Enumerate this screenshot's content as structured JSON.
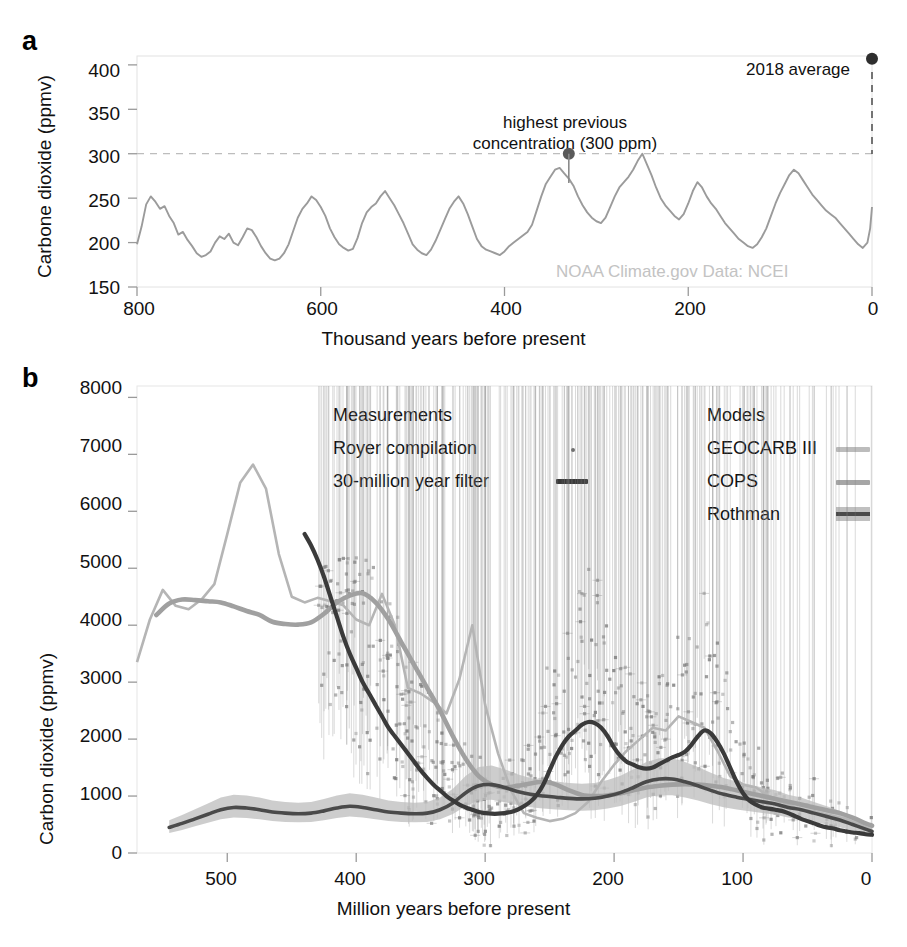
{
  "figure": {
    "panel_a_label": "a",
    "panel_b_label": "b"
  },
  "panel_a": {
    "ylabel": "Carbone dioxide (ppmv)",
    "xlabel": "Thousand years before present",
    "yticks": [
      "400",
      "350",
      "300",
      "250",
      "200",
      "150"
    ],
    "xticks": [
      "800",
      "600",
      "400",
      "200",
      "0"
    ],
    "annotation_2018": "2018 average",
    "annotation_highest_line1": "highest previous",
    "annotation_highest_line2": "concentration (300 ppm)",
    "credit": "NOAA Climate.gov  Data: NCEI",
    "curve_color": "#9b9b9b",
    "marker_color": "#3d3d3d"
  },
  "panel_b": {
    "ylabel": "Carbon dioxide (ppmv)",
    "xlabel": "Million years before present",
    "yticks": [
      "8000",
      "7000",
      "6000",
      "5000",
      "4000",
      "3000",
      "2000",
      "1000",
      "0"
    ],
    "xticks": [
      "500",
      "400",
      "300",
      "200",
      "100",
      "0"
    ],
    "legend": {
      "measurements_title": "Measurements",
      "royer_label": "Royer compilation",
      "filter_label": "30-million year filter",
      "models_title": "Models",
      "geocarb_label": "GEOCARB III",
      "cops_label": "COPS",
      "rothman_label": "Rothman"
    },
    "colors": {
      "geocarb": "#b5b5b5",
      "cops": "#a0a0a0",
      "rothman_line": "#4a4a4a",
      "rothman_band": "#b9b9b9",
      "filter_line": "#3a3a3a",
      "royer_points": "#7d7d7d"
    }
  },
  "chart_data": [
    {
      "type": "line",
      "panel": "a",
      "title": "",
      "xlabel": "Thousand years before present",
      "ylabel": "Carbone dioxide (ppmv)",
      "xlim": [
        800,
        0
      ],
      "ylim": [
        150,
        410
      ],
      "xticks": [
        800,
        600,
        400,
        200,
        0
      ],
      "yticks": [
        400,
        350,
        300,
        250,
        200,
        150
      ],
      "grid": false,
      "reference_line": {
        "y": 300,
        "style": "dashed",
        "label": "highest previous concentration (300 ppm)"
      },
      "annotations": [
        {
          "text": "2018 average",
          "x": 0,
          "y": 407
        },
        {
          "text": "highest previous concentration (300 ppm)",
          "x": 330,
          "y": 300
        }
      ],
      "markers": [
        {
          "name": "2018-average",
          "x": 0,
          "y": 407
        },
        {
          "name": "highest-previous",
          "x": 330,
          "y": 300
        }
      ],
      "series": [
        {
          "name": "Ice core CO2",
          "x": [
            800,
            795,
            790,
            785,
            780,
            775,
            770,
            765,
            760,
            755,
            750,
            745,
            740,
            735,
            730,
            725,
            720,
            715,
            710,
            705,
            700,
            695,
            690,
            685,
            680,
            675,
            670,
            665,
            660,
            655,
            650,
            645,
            640,
            635,
            630,
            625,
            620,
            615,
            610,
            605,
            600,
            595,
            590,
            585,
            580,
            575,
            570,
            565,
            560,
            555,
            550,
            545,
            540,
            535,
            530,
            525,
            520,
            515,
            510,
            505,
            500,
            495,
            490,
            485,
            480,
            475,
            470,
            465,
            460,
            455,
            450,
            445,
            440,
            435,
            430,
            425,
            420,
            415,
            410,
            405,
            400,
            395,
            390,
            385,
            380,
            375,
            370,
            365,
            360,
            355,
            350,
            345,
            340,
            335,
            330,
            325,
            320,
            315,
            310,
            305,
            300,
            295,
            290,
            285,
            280,
            275,
            270,
            265,
            260,
            255,
            250,
            245,
            240,
            235,
            230,
            225,
            220,
            215,
            210,
            205,
            200,
            195,
            190,
            185,
            180,
            175,
            170,
            165,
            160,
            155,
            150,
            145,
            140,
            135,
            130,
            125,
            120,
            115,
            110,
            105,
            100,
            95,
            90,
            85,
            80,
            75,
            70,
            65,
            60,
            55,
            50,
            45,
            40,
            35,
            30,
            25,
            20,
            15,
            10,
            5,
            2,
            0
          ],
          "y": [
            198,
            218,
            243,
            252,
            246,
            238,
            241,
            230,
            222,
            209,
            212,
            203,
            196,
            188,
            184,
            186,
            190,
            200,
            207,
            204,
            210,
            200,
            197,
            206,
            216,
            214,
            206,
            196,
            188,
            182,
            180,
            182,
            188,
            198,
            213,
            228,
            238,
            244,
            252,
            248,
            240,
            230,
            216,
            206,
            198,
            194,
            191,
            193,
            205,
            222,
            234,
            240,
            244,
            252,
            258,
            250,
            242,
            232,
            222,
            210,
            198,
            192,
            188,
            186,
            192,
            202,
            214,
            226,
            238,
            246,
            252,
            244,
            232,
            218,
            204,
            196,
            192,
            190,
            188,
            186,
            190,
            196,
            200,
            204,
            208,
            212,
            220,
            236,
            252,
            266,
            274,
            282,
            284,
            278,
            272,
            264,
            252,
            242,
            234,
            228,
            224,
            222,
            228,
            240,
            252,
            262,
            268,
            274,
            282,
            292,
            300,
            288,
            276,
            262,
            250,
            242,
            236,
            230,
            226,
            232,
            244,
            258,
            268,
            262,
            252,
            244,
            238,
            230,
            222,
            216,
            210,
            204,
            200,
            196,
            194,
            198,
            206,
            216,
            230,
            244,
            256,
            266,
            276,
            282,
            278,
            270,
            262,
            254,
            248,
            242,
            236,
            232,
            228,
            222,
            216,
            210,
            204,
            198,
            194,
            200,
            216,
            240,
            262,
            276,
            284,
            286
          ]
        }
      ]
    },
    {
      "type": "line",
      "panel": "b",
      "title": "",
      "xlabel": "Million years before present",
      "ylabel": "Carbon dioxide (ppmv)",
      "xlim": [
        570,
        0
      ],
      "ylim": [
        0,
        8200
      ],
      "xticks": [
        500,
        400,
        300,
        200,
        100,
        0
      ],
      "yticks": [
        0,
        1000,
        2000,
        3000,
        4000,
        5000,
        6000,
        7000,
        8000
      ],
      "grid": false,
      "legend_position": "upper-center",
      "series": [
        {
          "name": "GEOCARB III",
          "x": [
            570,
            560,
            550,
            540,
            530,
            520,
            510,
            500,
            490,
            480,
            470,
            460,
            450,
            440,
            430,
            420,
            410,
            400,
            390,
            380,
            370,
            360,
            350,
            340,
            330,
            320,
            310,
            300,
            290,
            280,
            270,
            260,
            250,
            240,
            230,
            220,
            210,
            200,
            190,
            180,
            170,
            160,
            150,
            140,
            130,
            120,
            110,
            100,
            90,
            80,
            70,
            60,
            50,
            40,
            30,
            20,
            10,
            0
          ],
          "y": [
            3350,
            4100,
            4620,
            4340,
            4280,
            4450,
            4720,
            5600,
            6500,
            6820,
            6400,
            5250,
            4500,
            4400,
            4480,
            4420,
            4350,
            4100,
            4000,
            4550,
            4000,
            2900,
            2800,
            2650,
            2450,
            3050,
            4000,
            2600,
            1750,
            1100,
            700,
            620,
            560,
            600,
            700,
            900,
            1250,
            1550,
            1800,
            2000,
            2200,
            2150,
            2400,
            2300,
            2200,
            1800,
            1350,
            1200,
            1150,
            1000,
            900,
            800,
            750,
            700,
            650,
            600,
            500,
            400
          ]
        },
        {
          "name": "COPS",
          "x": [
            555,
            545,
            535,
            525,
            515,
            505,
            495,
            485,
            475,
            465,
            455,
            445,
            435,
            425,
            415,
            405,
            395,
            385,
            375,
            365,
            355,
            345,
            335,
            325,
            315,
            305,
            295,
            285,
            275,
            265,
            255,
            245,
            235,
            225,
            215,
            205,
            195,
            185,
            175,
            165,
            155,
            145,
            135,
            125,
            115,
            105,
            95,
            85,
            75,
            65,
            55,
            45,
            35,
            25,
            15,
            5,
            0
          ],
          "y": [
            4180,
            4380,
            4450,
            4440,
            4420,
            4400,
            4330,
            4250,
            4180,
            4060,
            4020,
            4010,
            4050,
            4200,
            4400,
            4520,
            4560,
            4400,
            4100,
            3700,
            3300,
            2900,
            2500,
            2050,
            1650,
            1350,
            1200,
            1150,
            1180,
            1220,
            1250,
            1200,
            1100,
            1020,
            1000,
            1010,
            1050,
            1100,
            1150,
            1180,
            1200,
            1210,
            1200,
            1180,
            1150,
            1100,
            1050,
            1000,
            950,
            900,
            850,
            800,
            750,
            700,
            620,
            520,
            480
          ]
        },
        {
          "name": "Rothman",
          "x": [
            545,
            535,
            525,
            515,
            505,
            495,
            485,
            475,
            465,
            455,
            445,
            435,
            425,
            415,
            405,
            395,
            385,
            375,
            365,
            355,
            345,
            335,
            325,
            315,
            305,
            295,
            285,
            275,
            265,
            255,
            245,
            235,
            225,
            215,
            205,
            195,
            185,
            175,
            165,
            155,
            145,
            135,
            125,
            115,
            105,
            95,
            85,
            75,
            65,
            55,
            45,
            35,
            25,
            15,
            5,
            0
          ],
          "y": [
            450,
            520,
            600,
            680,
            760,
            800,
            790,
            760,
            720,
            700,
            690,
            700,
            740,
            790,
            820,
            800,
            760,
            720,
            700,
            690,
            700,
            760,
            880,
            1060,
            1180,
            1200,
            1150,
            1080,
            1030,
            1000,
            980,
            960,
            950,
            960,
            1000,
            1060,
            1150,
            1250,
            1300,
            1300,
            1250,
            1180,
            1100,
            1030,
            980,
            940,
            900,
            860,
            800,
            760,
            700,
            640,
            580,
            500,
            420,
            380
          ],
          "band": true
        },
        {
          "name": "30-million year filter",
          "x": [
            440,
            435,
            430,
            425,
            420,
            415,
            410,
            405,
            400,
            395,
            390,
            385,
            380,
            375,
            370,
            365,
            360,
            355,
            350,
            345,
            340,
            335,
            330,
            325,
            320,
            315,
            310,
            305,
            300,
            295,
            290,
            285,
            280,
            275,
            270,
            265,
            260,
            255,
            250,
            245,
            240,
            235,
            230,
            225,
            220,
            215,
            210,
            205,
            200,
            195,
            190,
            185,
            180,
            175,
            170,
            165,
            160,
            155,
            150,
            145,
            140,
            135,
            130,
            125,
            120,
            115,
            110,
            105,
            100,
            95,
            90,
            85,
            80,
            75,
            70,
            65,
            60,
            55,
            50,
            45,
            40,
            35,
            30,
            25,
            20,
            15,
            10,
            5,
            0
          ],
          "y": [
            5600,
            5400,
            5150,
            4850,
            4500,
            4150,
            3800,
            3500,
            3250,
            3000,
            2800,
            2600,
            2400,
            2200,
            2050,
            1900,
            1750,
            1600,
            1450,
            1320,
            1200,
            1100,
            1000,
            920,
            850,
            800,
            760,
            720,
            700,
            690,
            690,
            700,
            720,
            760,
            820,
            900,
            1020,
            1200,
            1450,
            1700,
            1900,
            2050,
            2150,
            2250,
            2300,
            2280,
            2200,
            2050,
            1850,
            1700,
            1600,
            1550,
            1500,
            1480,
            1500,
            1560,
            1620,
            1680,
            1720,
            1780,
            1900,
            2050,
            2150,
            2100,
            1950,
            1750,
            1500,
            1250,
            1050,
            920,
            850,
            800,
            780,
            760,
            740,
            700,
            650,
            600,
            560,
            520,
            480,
            450,
            430,
            400,
            380,
            360,
            350,
            330,
            320
          ]
        }
      ],
      "scatter": {
        "name": "Royer compilation",
        "description": "Proxy CO2 estimates with vertical uncertainty bars, densest between 400 Ma and 0 Ma, values ranging roughly 200-5000 ppmv"
      }
    }
  ]
}
